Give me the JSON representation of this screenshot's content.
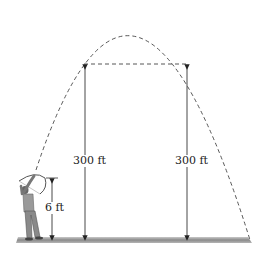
{
  "diagram": {
    "labels": {
      "left_height": "300 ft",
      "right_height": "300 ft",
      "archer_height": "6 ft"
    },
    "colors": {
      "line": "#333333",
      "ground_dark": "#7a7a7a",
      "ground_light": "#d0d0d0"
    }
  }
}
